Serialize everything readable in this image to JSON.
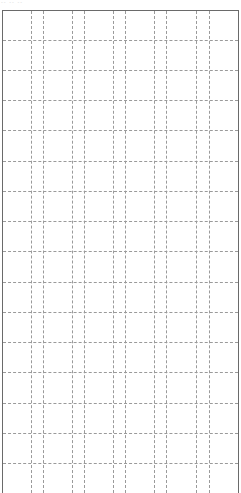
{
  "page": {
    "header_text": "‐‐ ‐‐ ‐‐",
    "background": "#ffffff",
    "border_color": "#6a6a6a",
    "grid_line_color": "#9a9a9a"
  },
  "grid": {
    "columns_x": [
      31,
      43,
      72,
      84,
      113,
      125,
      154,
      166,
      196,
      209
    ],
    "rows_y": [
      40,
      70,
      100,
      130,
      161,
      191,
      221,
      251,
      282,
      312,
      342,
      372,
      403,
      433,
      463
    ]
  }
}
